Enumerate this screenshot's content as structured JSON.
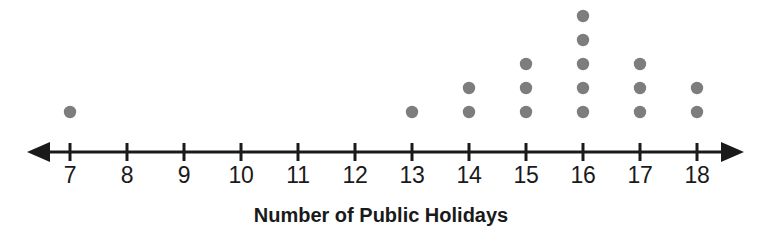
{
  "chart_data": {
    "type": "scatter",
    "plot_style": "dot-plot",
    "title": "",
    "xlabel": "Number of Public Holidays",
    "ylabel": "",
    "categories": [
      "7",
      "8",
      "9",
      "10",
      "11",
      "12",
      "13",
      "14",
      "15",
      "16",
      "17",
      "18"
    ],
    "x": [
      7,
      8,
      9,
      10,
      11,
      12,
      13,
      14,
      15,
      16,
      17,
      18
    ],
    "values": [
      1,
      0,
      0,
      0,
      0,
      0,
      1,
      2,
      3,
      5,
      3,
      2
    ],
    "series": [
      {
        "name": "Counts",
        "values": [
          1,
          0,
          0,
          0,
          0,
          0,
          1,
          2,
          3,
          5,
          3,
          2
        ]
      }
    ],
    "tick_labels": [
      "7",
      "8",
      "9",
      "10",
      "11",
      "12",
      "13",
      "14",
      "15",
      "16",
      "17",
      "18"
    ],
    "xlim": [
      7,
      18
    ],
    "ylim": [
      0,
      5
    ],
    "total_dots": 17,
    "grid": false,
    "legend": "none",
    "axis_arrows": [
      "left",
      "right"
    ],
    "dot_color": "#7d7d7d",
    "axis_color": "#1a1a1a",
    "background_color": "#ffffff"
  },
  "axis": {
    "title": "Number of Public Holidays",
    "left_arrow_name": "left-arrowhead",
    "right_arrow_name": "right-arrowhead"
  }
}
